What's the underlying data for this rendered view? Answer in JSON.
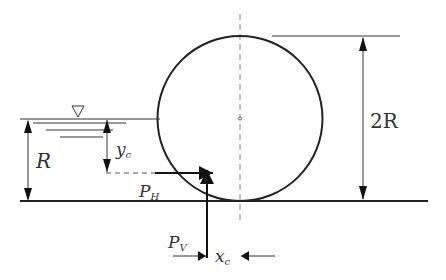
{
  "diagram": {
    "labels": {
      "radius": "R",
      "diameter": "2R",
      "depth_centroid_main": "y",
      "depth_centroid_sub": "c",
      "horizontal_force_main": "P",
      "horizontal_force_sub": "H",
      "vertical_force_main": "P",
      "vertical_force_sub": "V",
      "horizontal_offset_main": "x",
      "horizontal_offset_sub": "c"
    },
    "symbols": {
      "water_surface": "inverted-triangle"
    },
    "colors": {
      "stroke": "#222222",
      "dim_line": "#444444",
      "axis": "#888888",
      "background": "#ffffff"
    }
  }
}
